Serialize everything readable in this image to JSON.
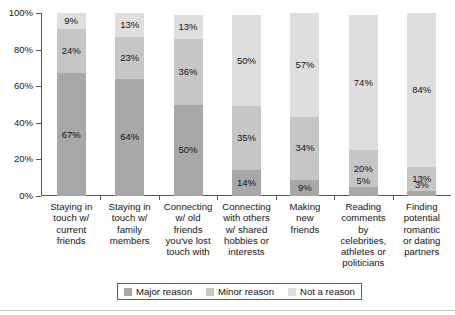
{
  "chart_data": {
    "type": "bar",
    "subtype": "stacked-100-percent",
    "title": "",
    "subtitle": "",
    "xlabel": "",
    "ylabel": "",
    "ylim": [
      0,
      100
    ],
    "grid": false,
    "legend_position": "bottom",
    "categories": [
      "Staying in touch w/ current friends",
      "Staying in touch w/ family members",
      "Connecting w/ old friends you've lost touch with",
      "Connecting with others w/ shared hobbies or interests",
      "Making new friends",
      "Reading comments by celebrities, athletes or politicians",
      "Finding potential romantic or dating partners"
    ],
    "category_lines": [
      [
        "Staying in",
        "touch w/",
        "current",
        "friends"
      ],
      [
        "Staying in",
        "touch w/",
        "family",
        "members"
      ],
      [
        "Connecting",
        "w/ old",
        "friends",
        "you've lost",
        "touch with"
      ],
      [
        "Connecting",
        "with others",
        "w/ shared",
        "hobbies or",
        "interests"
      ],
      [
        "Making",
        "new",
        "friends"
      ],
      [
        "Reading",
        "comments",
        "by celebrities,",
        "athletes or",
        "politicians"
      ],
      [
        "Finding",
        "potential",
        "romantic",
        "or dating",
        "partners"
      ]
    ],
    "series": [
      {
        "name": "Major reason",
        "color": "#a8a8a8",
        "values": [
          67,
          64,
          50,
          14,
          9,
          5,
          3
        ],
        "labels": [
          "67%",
          "64%",
          "50%",
          "14%",
          "9%",
          "5%",
          "3%"
        ]
      },
      {
        "name": "Minor reason",
        "color": "#c6c6c6",
        "values": [
          24,
          23,
          36,
          35,
          34,
          20,
          13
        ],
        "labels": [
          "24%",
          "23%",
          "36%",
          "35%",
          "34%",
          "20%",
          "13%"
        ]
      },
      {
        "name": "Not a reason",
        "color": "#dedede",
        "values": [
          9,
          13,
          13,
          50,
          57,
          74,
          84
        ],
        "labels": [
          "9%",
          "13%",
          "13%",
          "50%",
          "57%",
          "74%",
          "84%"
        ]
      }
    ],
    "y_ticks": [
      {
        "value": 100,
        "label": "100%"
      },
      {
        "value": 80,
        "label": "80%"
      },
      {
        "value": 60,
        "label": "60%"
      },
      {
        "value": 40,
        "label": "40%"
      },
      {
        "value": 20,
        "label": "20%"
      },
      {
        "value": 0,
        "label": "0%"
      }
    ]
  },
  "legend": {
    "items": [
      {
        "label": "Major reason",
        "color": "#a8a8a8"
      },
      {
        "label": "Minor reason",
        "color": "#c6c6c6"
      },
      {
        "label": "Not a reason",
        "color": "#dedede"
      }
    ]
  }
}
